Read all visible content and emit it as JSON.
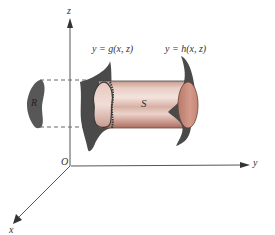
{
  "diagram": {
    "axes": {
      "z_label": "z",
      "y_label": "y",
      "x_label": "x",
      "origin_label": "O"
    },
    "region_label": "R",
    "solid_label": "S",
    "left_surface_label": "y = g(x, z)",
    "right_surface_label": "y = h(x, z)",
    "colors": {
      "axis": "#555555",
      "surface": "#4a4a4a",
      "region": "#555555",
      "cylinder_light": "#efd9d2",
      "cylinder_mid": "#d9aea1",
      "cylinder_dark": "#b07868",
      "end_cap": "#c8887a",
      "dashed": "#666666"
    }
  }
}
